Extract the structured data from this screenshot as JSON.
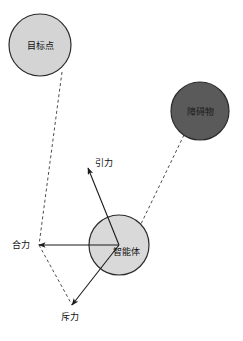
{
  "figure": {
    "width": 243,
    "height": 341,
    "background": "#ffffff"
  },
  "colors": {
    "background": "#ffffff",
    "target_fill": "#d4d4d4",
    "target_stroke": "#2b2b2b",
    "obstacle_fill": "#5a5a5a",
    "obstacle_stroke": "#2b2b2b",
    "agent_fill": "#d9d9d9",
    "agent_stroke": "#2b2b2b",
    "vector_stroke": "#1a1a1a",
    "dashed_stroke": "#4d4d4d",
    "text": "#111111"
  },
  "nodes": [
    {
      "id": "target",
      "label": "目标点",
      "cx": 40,
      "cy": 45,
      "r": 31,
      "fill": "#d4d4d4",
      "stroke": "#2b2b2b"
    },
    {
      "id": "obstacle",
      "label": "障碍物",
      "cx": 200,
      "cy": 111,
      "r": 29,
      "fill": "#5a5a5a",
      "stroke": "#2b2b2b"
    },
    {
      "id": "agent",
      "label": "智能体",
      "cx": 119,
      "cy": 245,
      "r": 30,
      "fill": "#d9d9d9",
      "stroke": "#2b2b2b"
    }
  ],
  "vectors": [
    {
      "id": "attraction",
      "label": "引力",
      "from_x": 119,
      "from_y": 245,
      "to_x": 88,
      "to_y": 168,
      "label_x": 95,
      "label_y": 166
    },
    {
      "id": "repulsion",
      "label": "斥力",
      "from_x": 119,
      "from_y": 245,
      "to_x": 72,
      "to_y": 305,
      "label_x": 61,
      "label_y": 320
    },
    {
      "id": "resultant",
      "label": "合力",
      "from_x": 119,
      "from_y": 245,
      "to_x": 39,
      "to_y": 245,
      "label_x": 12,
      "label_y": 248
    }
  ],
  "dashed_lines": [
    {
      "id": "target-to-resultant-tip",
      "x1": 62,
      "y1": 72,
      "x2": 39,
      "y2": 245
    },
    {
      "id": "obstacle-to-agent",
      "x1": 184,
      "y1": 135,
      "x2": 140,
      "y2": 226
    },
    {
      "id": "parallelogram-lower-side",
      "x1": 39,
      "y1": 245,
      "x2": 72,
      "y2": 305
    }
  ],
  "legend": {
    "attraction_term": "引力",
    "repulsion_term": "斥力",
    "resultant_term": "合力",
    "target_term": "目标点",
    "obstacle_term": "障碍物",
    "agent_term": "智能体"
  }
}
